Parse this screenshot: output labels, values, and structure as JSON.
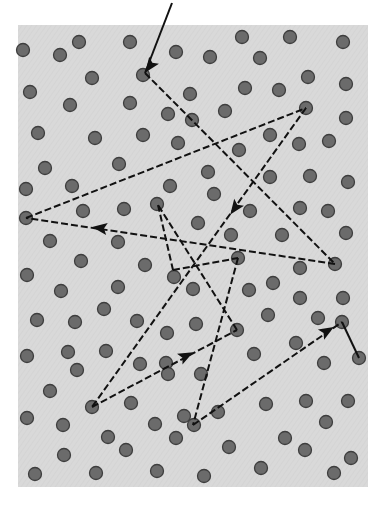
{
  "diagram": {
    "colors": {
      "background": "#ffffff",
      "box": "#d9d9d9",
      "dot_fill": "#6b6b6b",
      "dot_stroke": "#3e3e3e",
      "path": "#111111"
    },
    "box": {
      "x": 18,
      "y": 25,
      "width": 350,
      "height": 462
    },
    "dot_radius": 6.5,
    "dots": [
      [
        23,
        50
      ],
      [
        60,
        55
      ],
      [
        79,
        42
      ],
      [
        130,
        42
      ],
      [
        92,
        78
      ],
      [
        143,
        75
      ],
      [
        176,
        52
      ],
      [
        30,
        92
      ],
      [
        70,
        105
      ],
      [
        130,
        103
      ],
      [
        168,
        114
      ],
      [
        38,
        133
      ],
      [
        95,
        138
      ],
      [
        143,
        135
      ],
      [
        178,
        143
      ],
      [
        192,
        120
      ],
      [
        242,
        37
      ],
      [
        290,
        37
      ],
      [
        343,
        42
      ],
      [
        210,
        57
      ],
      [
        260,
        58
      ],
      [
        308,
        77
      ],
      [
        346,
        84
      ],
      [
        245,
        88
      ],
      [
        279,
        90
      ],
      [
        190,
        94
      ],
      [
        225,
        111
      ],
      [
        306,
        108
      ],
      [
        346,
        118
      ],
      [
        270,
        135
      ],
      [
        299,
        144
      ],
      [
        329,
        141
      ],
      [
        239,
        150
      ],
      [
        45,
        168
      ],
      [
        119,
        164
      ],
      [
        26,
        189
      ],
      [
        72,
        186
      ],
      [
        170,
        186
      ],
      [
        83,
        211
      ],
      [
        124,
        209
      ],
      [
        157,
        204
      ],
      [
        26,
        218
      ],
      [
        50,
        241
      ],
      [
        118,
        242
      ],
      [
        81,
        261
      ],
      [
        145,
        265
      ],
      [
        208,
        172
      ],
      [
        270,
        177
      ],
      [
        310,
        176
      ],
      [
        348,
        182
      ],
      [
        214,
        194
      ],
      [
        250,
        211
      ],
      [
        300,
        208
      ],
      [
        328,
        211
      ],
      [
        198,
        223
      ],
      [
        231,
        235
      ],
      [
        282,
        235
      ],
      [
        346,
        233
      ],
      [
        238,
        258
      ],
      [
        300,
        268
      ],
      [
        335,
        264
      ],
      [
        27,
        275
      ],
      [
        61,
        291
      ],
      [
        118,
        287
      ],
      [
        174,
        277
      ],
      [
        104,
        309
      ],
      [
        37,
        320
      ],
      [
        75,
        322
      ],
      [
        137,
        321
      ],
      [
        167,
        333
      ],
      [
        27,
        356
      ],
      [
        68,
        352
      ],
      [
        106,
        351
      ],
      [
        166,
        363
      ],
      [
        77,
        370
      ],
      [
        140,
        364
      ],
      [
        193,
        289
      ],
      [
        249,
        290
      ],
      [
        273,
        283
      ],
      [
        300,
        298
      ],
      [
        343,
        298
      ],
      [
        268,
        315
      ],
      [
        318,
        318
      ],
      [
        196,
        324
      ],
      [
        237,
        330
      ],
      [
        342,
        322
      ],
      [
        296,
        343
      ],
      [
        254,
        354
      ],
      [
        359,
        358
      ],
      [
        324,
        363
      ],
      [
        50,
        391
      ],
      [
        92,
        407
      ],
      [
        131,
        403
      ],
      [
        168,
        374
      ],
      [
        184,
        416
      ],
      [
        155,
        424
      ],
      [
        27,
        418
      ],
      [
        63,
        425
      ],
      [
        108,
        437
      ],
      [
        126,
        450
      ],
      [
        176,
        438
      ],
      [
        64,
        455
      ],
      [
        35,
        474
      ],
      [
        96,
        473
      ],
      [
        157,
        471
      ],
      [
        204,
        476
      ],
      [
        261,
        468
      ],
      [
        201,
        374
      ],
      [
        218,
        412
      ],
      [
        266,
        404
      ],
      [
        306,
        401
      ],
      [
        348,
        401
      ],
      [
        326,
        422
      ],
      [
        285,
        438
      ],
      [
        305,
        450
      ],
      [
        351,
        458
      ],
      [
        334,
        473
      ],
      [
        194,
        425
      ],
      [
        229,
        447
      ]
    ],
    "path": {
      "entry": {
        "from": [
          172,
          3
        ],
        "to": [
          145,
          73
        ],
        "style": "solid"
      },
      "vertices": [
        [
          145,
          73
        ],
        [
          335,
          264
        ],
        [
          26,
          218
        ],
        [
          306,
          108
        ],
        [
          92,
          407
        ],
        [
          237,
          330
        ],
        [
          158,
          205
        ],
        [
          173,
          270
        ],
        [
          238,
          258
        ],
        [
          193,
          425
        ],
        [
          342,
          322
        ]
      ],
      "exit": {
        "from": [
          342,
          322
        ],
        "to": [
          359,
          358
        ],
        "style": "solid"
      },
      "arrows": [
        {
          "at": [
            150,
            66
          ],
          "toward": [
            145,
            73
          ]
        },
        {
          "at": [
            100,
            228
          ],
          "toward": [
            26,
            218
          ]
        },
        {
          "at": [
            235,
            208
          ],
          "toward": [
            92,
            407
          ]
        },
        {
          "at": [
            186,
            356
          ],
          "toward": [
            237,
            330
          ]
        },
        {
          "at": [
            327,
            331
          ],
          "toward": [
            342,
            322
          ]
        }
      ]
    }
  }
}
